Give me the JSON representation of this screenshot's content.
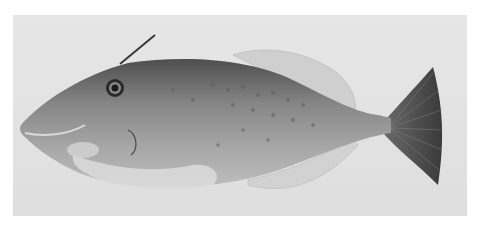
{
  "image": {
    "subject": "filefish specimen (side view, grayscale photograph)",
    "background_color": "#e3e3e3",
    "frame_color": "#ffffff",
    "fish_colors": {
      "body": "#8a8a8a",
      "dorsal": "#5a5a5a",
      "belly": "#d0d0d0",
      "tail": "#4a4a4a",
      "fins": "#c8c8c8"
    }
  }
}
